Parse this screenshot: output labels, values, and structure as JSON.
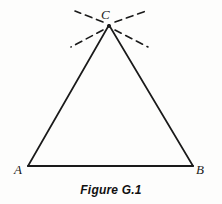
{
  "figure": {
    "caption": "Figure G.1",
    "background_color": "#fdfdfc",
    "ink_color": "#1a1a1a",
    "vertices": {
      "A": {
        "label": "A",
        "x": 28,
        "y": 166
      },
      "B": {
        "label": "B",
        "x": 193,
        "y": 166
      },
      "C": {
        "label": "C",
        "x": 109,
        "y": 25
      }
    },
    "sides": [
      {
        "name": "side-AC",
        "from": "A",
        "to": "C",
        "style": "solid"
      },
      {
        "name": "side-CB",
        "from": "C",
        "to": "B",
        "style": "solid"
      },
      {
        "name": "side-AB",
        "from": "A",
        "to": "B",
        "style": "solid"
      }
    ],
    "construction_rays": [
      {
        "name": "ray-upper-left",
        "x1": 103,
        "y1": 22,
        "x2": 75,
        "y2": 11,
        "style": "dashed"
      },
      {
        "name": "ray-upper-right",
        "x1": 115,
        "y1": 22,
        "x2": 146,
        "y2": 11,
        "style": "dashed"
      },
      {
        "name": "ray-lower-left",
        "x1": 103,
        "y1": 30,
        "x2": 71,
        "y2": 47,
        "style": "dashed"
      },
      {
        "name": "ray-lower-right",
        "x1": 115,
        "y1": 30,
        "x2": 148,
        "y2": 47,
        "style": "dashed"
      }
    ]
  }
}
